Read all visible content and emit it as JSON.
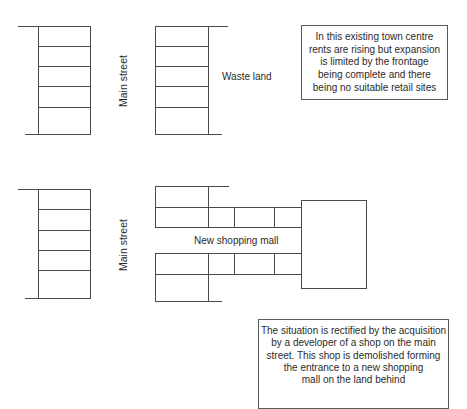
{
  "diagram": {
    "panel_before": {
      "street_label": "Main street",
      "land_label": "Waste land",
      "shops_left_count": 5,
      "shops_right_count": 5,
      "note_lines": [
        "In this existing town centre",
        "rents are rising but expansion",
        "is limited by the frontage",
        "being complete and there",
        "being no suitable retail sites"
      ]
    },
    "panel_after": {
      "street_label": "Main street",
      "mall_label": "New shopping mall",
      "note_lines": [
        "The situation is rectified by the acquisition",
        "by a developer of a shop on the main",
        "street. This shop is demolished forming",
        "the entrance to a new shopping",
        "mall on the land behind"
      ]
    },
    "colors": {
      "line": "#4a4a4a",
      "text": "#2b2b2b",
      "background": "#ffffff"
    }
  }
}
